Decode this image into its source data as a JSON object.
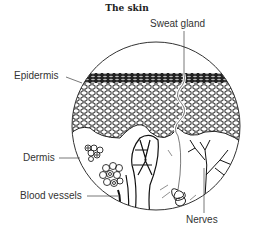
{
  "diagram": {
    "title": "The skin",
    "labels": {
      "sweat_gland": "Sweat gland",
      "epidermis": "Epidermis",
      "dermis": "Dermis",
      "blood_vessels": "Blood vessels",
      "nerves": "Nerves"
    },
    "colors": {
      "ink": "#1a1a1a",
      "leader": "#555555",
      "background": "#ffffff"
    }
  }
}
